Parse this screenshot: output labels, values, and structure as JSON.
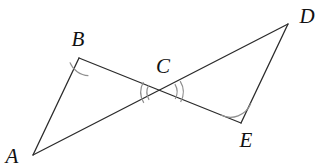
{
  "figure": {
    "kind": "geometry-diagram",
    "canvas": {
      "width": 331,
      "height": 167,
      "background": "#ffffff"
    },
    "stroke": {
      "color": "#2b2b2b",
      "width": 1.3
    },
    "arc_stroke": {
      "color": "#8c8c8c",
      "width": 1.2
    },
    "points": [
      {
        "id": "A",
        "label": "A",
        "x": 33,
        "y": 155,
        "label_x": 12,
        "label_y": 156
      },
      {
        "id": "B",
        "label": "B",
        "x": 79,
        "y": 58,
        "label_x": 78,
        "label_y": 39
      },
      {
        "id": "C",
        "label": "C",
        "x": 162,
        "y": 92,
        "label_x": 163,
        "label_y": 66
      },
      {
        "id": "D",
        "label": "D",
        "x": 288,
        "y": 24,
        "label_x": 307,
        "label_y": 16
      },
      {
        "id": "E",
        "label": "E",
        "x": 241,
        "y": 123,
        "label_x": 246,
        "label_y": 140
      }
    ],
    "segments": [
      {
        "id": "AB",
        "from": "A",
        "to": "B",
        "x1": 33,
        "y1": 155,
        "x2": 79,
        "y2": 58
      },
      {
        "id": "AD",
        "from": "A",
        "to": "D",
        "x1": 33,
        "y1": 155,
        "x2": 288,
        "y2": 24
      },
      {
        "id": "BE",
        "from": "B",
        "to": "E",
        "x1": 79,
        "y1": 58,
        "x2": 241,
        "y2": 123
      },
      {
        "id": "DE",
        "from": "D",
        "to": "E",
        "x1": 288,
        "y1": 24,
        "x2": 241,
        "y2": 123
      }
    ],
    "angle_marks": [
      {
        "id": "angle-B",
        "at": "B",
        "arcs": 1,
        "radius": 20
      },
      {
        "id": "angle-E",
        "at": "E",
        "arcs": 1,
        "radius": 21
      },
      {
        "id": "angle-C-left",
        "at": "C",
        "arcs": 2,
        "radius": 20
      },
      {
        "id": "angle-C-right",
        "at": "C",
        "arcs": 2,
        "radius": 20
      }
    ]
  }
}
